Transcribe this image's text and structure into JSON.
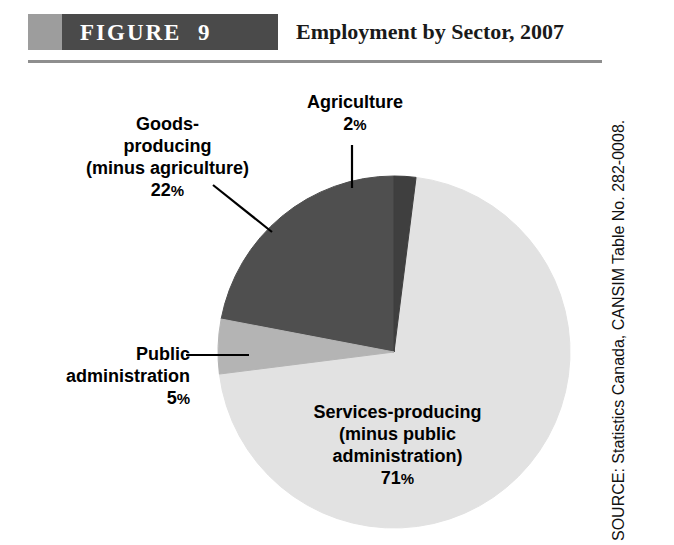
{
  "figure": {
    "banner_label": "FIGURE",
    "banner_number": "9",
    "title": "Employment by Sector, 2007",
    "banner_light_color": "#9d9d9d",
    "banner_dark_color": "#4a4a4a",
    "rule_color": "#8e8e8e"
  },
  "source": {
    "text": "SOURCE: Statistics Canada, CANSIM Table No. 282-0008."
  },
  "labels": {
    "agriculture": {
      "line1": "Agriculture",
      "value": "2",
      "pct": "%"
    },
    "goods": {
      "line1": "Goods-",
      "line2": "producing",
      "line3": "(minus agriculture)",
      "value": "22",
      "pct": "%"
    },
    "public": {
      "line1": "Public",
      "line2": "administration",
      "value": "5",
      "pct": "%"
    },
    "services": {
      "line1": "Services-producing",
      "line2": "(minus public",
      "line3": "administration)",
      "value": "71",
      "pct": "%"
    }
  },
  "chart_data": {
    "type": "pie",
    "title": "Employment by Sector, 2007",
    "xlabel": "",
    "ylabel": "",
    "legend": "none",
    "grid": false,
    "unit": "percent",
    "categories": [
      "Agriculture",
      "Services-producing (minus public administration)",
      "Public administration",
      "Goods-producing (minus agriculture)"
    ],
    "values": [
      2,
      71,
      5,
      22
    ],
    "labels": [
      "2%",
      "71%",
      "5%",
      "22%"
    ],
    "colors": [
      "#3f3f3f",
      "#e2e2e2",
      "#b4b4b4",
      "#4f4f4f"
    ],
    "start_angle_deg": -90,
    "direction": "clockwise",
    "annotations": [
      "Agriculture 2%",
      "Goods-producing (minus agriculture) 22%",
      "Public administration 5%",
      "Services-producing (minus public administration) 71%"
    ]
  }
}
